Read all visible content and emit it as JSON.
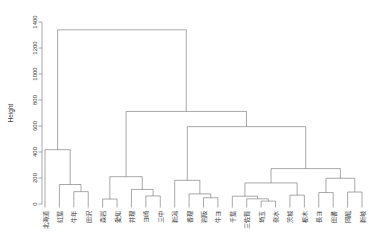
{
  "chart_data": {
    "type": "dendrogram",
    "title": "",
    "subtitle": "",
    "xlabel": "",
    "ylabel": "Height",
    "ylim": [
      0,
      1400
    ],
    "yticks": [
      0,
      200,
      400,
      600,
      800,
      1000,
      1200,
      1400
    ],
    "ytick_labels": [
      "0",
      "200",
      "400",
      "600",
      "800",
      "1000",
      "1200",
      "1400"
    ],
    "grid": false,
    "legend": "none",
    "leaf_label_rotation": -90,
    "n_leaves": 24,
    "leaves": [
      "北海道",
      "紅葉",
      "牛年",
      "田沢",
      "森岩",
      "愛知",
      "井理",
      "ヨ崎",
      "三中",
      "新潟",
      "香理",
      "岩阪",
      "牛ヨ",
      "千葉",
      "三佐賀",
      "埼玉",
      "奈水",
      "茨城",
      "栃木",
      "長ヨ",
      "田書",
      "岡龍",
      "新岐"
    ],
    "merges": [
      {
        "id": "m1",
        "height": 95,
        "left": "牛年",
        "right": "田沢"
      },
      {
        "id": "m2",
        "height": 150,
        "left": "紅葉",
        "right": "m1"
      },
      {
        "id": "m3",
        "height": 418,
        "left": "北海道",
        "right": "m2"
      },
      {
        "id": "m4",
        "height": 38,
        "left": "森岩",
        "right": "愛知"
      },
      {
        "id": "m5",
        "height": 62,
        "left": "ヨ崎",
        "right": "三中"
      },
      {
        "id": "m6",
        "height": 112,
        "left": "井理",
        "right": "m5"
      },
      {
        "id": "m7",
        "height": 210,
        "left": "m4",
        "right": "m6"
      },
      {
        "id": "m8",
        "height": 48,
        "left": "岩阪",
        "right": "牛ヨ"
      },
      {
        "id": "m9",
        "height": 78,
        "left": "香理",
        "right": "m8"
      },
      {
        "id": "m10",
        "height": 182,
        "left": "新潟",
        "right": "m9"
      },
      {
        "id": "m11",
        "height": 22,
        "left": "埼玉",
        "right": "奈水"
      },
      {
        "id": "m12",
        "height": 40,
        "left": "三佐賀",
        "right": "m11"
      },
      {
        "id": "m13",
        "height": 60,
        "left": "千葉",
        "right": "m12"
      },
      {
        "id": "m14",
        "height": 68,
        "left": "茨城",
        "right": "栃木"
      },
      {
        "id": "m15",
        "height": 162,
        "left": "m13",
        "right": "m14"
      },
      {
        "id": "m16",
        "height": 88,
        "left": "長ヨ",
        "right": "田書"
      },
      {
        "id": "m17",
        "height": 92,
        "left": "岡龍",
        "right": "新岐"
      },
      {
        "id": "m18",
        "height": 198,
        "left": "m16",
        "right": "m17"
      },
      {
        "id": "m19",
        "height": 272,
        "left": "m15",
        "right": "m18"
      },
      {
        "id": "m20",
        "height": 595,
        "left": "m10",
        "right": "m19"
      },
      {
        "id": "m21",
        "height": 712,
        "left": "m7",
        "right": "m20"
      },
      {
        "id": "m22",
        "height": 1340,
        "left": "m3",
        "right": "m21"
      }
    ]
  }
}
